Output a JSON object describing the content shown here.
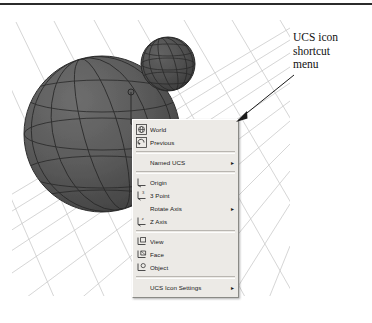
{
  "figure": {
    "annotation_lines": [
      "UCS icon",
      "shortcut",
      "menu"
    ],
    "annotation_text": "UCS icon shortcut menu",
    "colors": {
      "menu_background": "#eceae6",
      "menu_border_light": "#ffffff",
      "menu_border_dark": "#8a8a86",
      "menu_text": "#181818",
      "separator": "#b9b6b1",
      "grid_line": "#c9c9c9",
      "sphere_fill": "#5a5a5a",
      "sphere_wire": "#2e2e2e",
      "small_sphere_fill": "#4f4f4f",
      "viewport_background": "#ffffff",
      "rule": "#2b2b2b",
      "leader": "#1b1b1b",
      "ucs_icon": "#3a3a3a"
    }
  },
  "viewport": {
    "label": "3D model viewport",
    "objects": [
      {
        "name": "large-sphere",
        "shape": "sphere"
      },
      {
        "name": "small-sphere",
        "shape": "sphere"
      },
      {
        "name": "ground-grid",
        "shape": "perspective-grid"
      },
      {
        "name": "ucs-icon",
        "shape": "axis-tripod"
      }
    ]
  },
  "menu": {
    "name": "UCS icon shortcut menu",
    "groups": [
      {
        "items": [
          {
            "label": "World",
            "icon": "ucs-world-icon",
            "submenu": false
          },
          {
            "label": "Previous",
            "icon": "ucs-previous-icon",
            "submenu": false
          }
        ]
      },
      {
        "items": [
          {
            "label": "Named UCS",
            "icon": "blank-icon",
            "submenu": true
          }
        ]
      },
      {
        "items": [
          {
            "label": "Origin",
            "icon": "ucs-origin-icon",
            "submenu": false
          },
          {
            "label": "3 Point",
            "icon": "ucs-3point-icon",
            "submenu": false
          },
          {
            "label": "Rotate Axis",
            "icon": "blank-icon",
            "submenu": true
          },
          {
            "label": "Z Axis",
            "icon": "ucs-zaxis-icon",
            "submenu": false
          }
        ]
      },
      {
        "items": [
          {
            "label": "View",
            "icon": "ucs-view-icon",
            "submenu": false
          },
          {
            "label": "Face",
            "icon": "ucs-face-icon",
            "submenu": false
          },
          {
            "label": "Object",
            "icon": "ucs-object-icon",
            "submenu": false
          }
        ]
      },
      {
        "items": [
          {
            "label": "UCS Icon Settings",
            "icon": "blank-icon",
            "submenu": true
          }
        ]
      }
    ],
    "submenu_arrow_glyph": "▸"
  }
}
